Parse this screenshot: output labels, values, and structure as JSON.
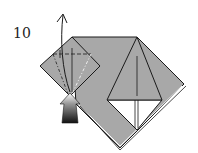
{
  "diagram": {
    "step_number": "10",
    "colors": {
      "paper": "#a8a8a8",
      "paper_reverse": "#ffffff",
      "line": "#1a1a1a",
      "arrow_dark": "#111111",
      "arrow_light": "#ffffff"
    },
    "elements": [
      {
        "name": "main-body",
        "type": "folded-paper"
      },
      {
        "name": "left-flap",
        "type": "diamond-flap",
        "folds": [
          "valley-fold-horizontal",
          "valley-fold-left",
          "valley-fold-right"
        ]
      },
      {
        "name": "center-triangle",
        "type": "raised-triangle"
      },
      {
        "name": "open-up-arrow",
        "type": "curved-arrow"
      },
      {
        "name": "push-arrow",
        "type": "solid-arrow"
      }
    ]
  }
}
